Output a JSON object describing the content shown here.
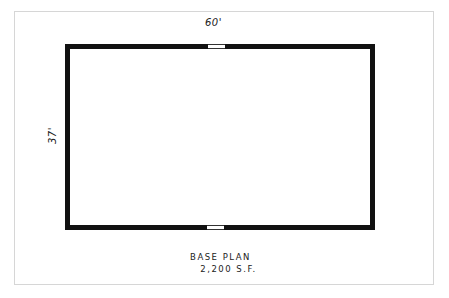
{
  "plan": {
    "width_dimension": "60'",
    "depth_dimension": "37'",
    "title": "BASE PLAN",
    "area": "2,200 S.F."
  },
  "colors": {
    "wall": "#111111",
    "sheet_border": "#d6d6d6",
    "background": "#ffffff"
  }
}
